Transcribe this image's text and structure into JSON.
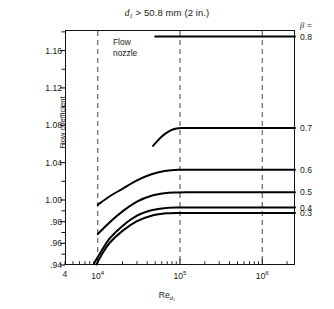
{
  "figure": {
    "title_main": "> 50.8 mm (2 in.)",
    "title_var": "d",
    "title_sub": "1"
  },
  "axes": {
    "ylabel_line1": "Flow coefficient",
    "ylabel_line2_main": "= CE",
    "ylabel_line2_var": "K",
    "ylabel_line2_sub": "o",
    "xlabel_main": "Re",
    "xlabel_sub": "d",
    "xlabel_subsub": "1",
    "y_ticks": [
      "1.16",
      "1.12",
      "1.08",
      "1.04",
      "1.00",
      ".98",
      ".96",
      ".94"
    ],
    "x_ticks": [
      {
        "text": "4",
        "sup": ""
      },
      {
        "text": "10",
        "sup": "4"
      },
      {
        "text": "10",
        "sup": "5"
      },
      {
        "text": "10",
        "sup": "6"
      }
    ]
  },
  "annotations": {
    "flow_nozzle_line1": "Flow",
    "flow_nozzle_line2": "nozzle",
    "beta_symbol": "β",
    "beta_equals": "=",
    "reference_lines": [
      "1e4",
      "1e5",
      "1e6"
    ]
  },
  "series_labels": [
    "0.8",
    "0.7",
    "0.6",
    "0.5",
    "0.4",
    "0.3"
  ],
  "colors": {
    "axis": "#111111",
    "curve": "#000000",
    "dashed": "#555555",
    "background": "#ffffff"
  },
  "chart_data": {
    "type": "line",
    "title": "d1 > 50.8 mm (2 in.)",
    "xlabel": "Re_d1",
    "ylabel": "Flow coefficient  K_o = CE",
    "xscale": "log",
    "xlim": [
      4000,
      2500000
    ],
    "ylim": [
      0.94,
      1.182
    ],
    "y_tick_values": [
      1.16,
      1.12,
      1.08,
      1.04,
      1.0,
      0.98,
      0.96,
      0.94
    ],
    "x_tick_values": [
      4000,
      10000,
      100000,
      1000000
    ],
    "grid": false,
    "legend": "right-edge series labels (beta)",
    "reference_lines_x": [
      10000,
      100000,
      1000000
    ],
    "series": [
      {
        "name": "0.8",
        "beta": 0.8,
        "x": [
          50000,
          100000,
          300000,
          1000000,
          2500000
        ],
        "y": [
          1.175,
          1.175,
          1.175,
          1.175,
          1.175
        ]
      },
      {
        "name": "0.7",
        "beta": 0.7,
        "x": [
          47000,
          60000,
          75000,
          90000,
          110000,
          200000,
          500000,
          1000000,
          2500000
        ],
        "y": [
          1.058,
          1.068,
          1.074,
          1.0765,
          1.077,
          1.077,
          1.077,
          1.077,
          1.077
        ]
      },
      {
        "name": "0.6",
        "beta": 0.6,
        "x": [
          10000,
          14000,
          20000,
          30000,
          45000,
          65000,
          90000,
          120000,
          300000,
          1000000,
          2500000
        ],
        "y": [
          0.9955,
          1.004,
          1.012,
          1.021,
          1.0275,
          1.031,
          1.0322,
          1.0325,
          1.0325,
          1.0325,
          1.0325
        ]
      },
      {
        "name": "0.5",
        "beta": 0.5,
        "x": [
          10000,
          14000,
          20000,
          30000,
          45000,
          65000,
          90000,
          120000,
          300000,
          1000000,
          2500000
        ],
        "y": [
          0.9685,
          0.9795,
          0.9895,
          0.9985,
          1.0045,
          1.0072,
          1.008,
          1.0082,
          1.0082,
          1.0082,
          1.0082
        ]
      },
      {
        "name": "0.4",
        "beta": 0.4,
        "x": [
          9000,
          11000,
          14000,
          20000,
          30000,
          45000,
          65000,
          90000,
          300000,
          1000000,
          2500000
        ],
        "y": [
          0.9415,
          0.9525,
          0.9645,
          0.976,
          0.9855,
          0.9905,
          0.9925,
          0.993,
          0.993,
          0.993,
          0.993
        ]
      },
      {
        "name": "0.3",
        "beta": 0.3,
        "x": [
          9600,
          11500,
          14000,
          20000,
          30000,
          45000,
          65000,
          90000,
          300000,
          1000000,
          2500000
        ],
        "y": [
          0.9405,
          0.951,
          0.9605,
          0.9715,
          0.9805,
          0.9855,
          0.9875,
          0.988,
          0.988,
          0.988,
          0.988
        ]
      }
    ]
  }
}
